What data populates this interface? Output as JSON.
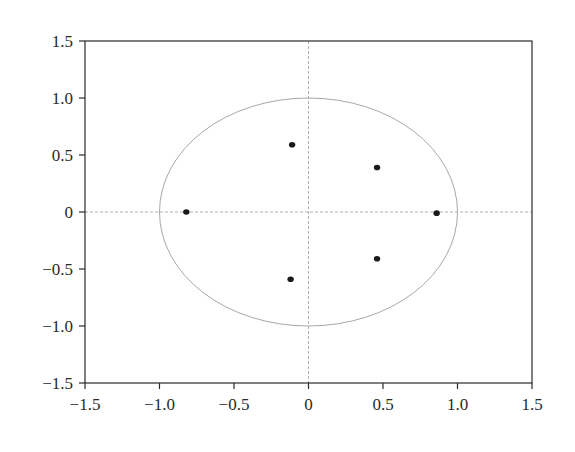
{
  "chart_data": {
    "type": "scatter",
    "title": "",
    "xlabel": "",
    "ylabel": "",
    "xlim": [
      -1.5,
      1.5
    ],
    "ylim": [
      -1.5,
      1.5
    ],
    "grid": false,
    "legend": null,
    "x_ticks": [
      "-1.5",
      "-1.0",
      "-0.5",
      "0",
      "0.5",
      "1.0",
      "1.5"
    ],
    "y_ticks": [
      "1.5",
      "1.0",
      "0.5",
      "0",
      "-0.5",
      "-1.0",
      "-1.5"
    ],
    "reference_lines": [
      {
        "orientation": "horizontal",
        "value": 0,
        "style": "dashed"
      },
      {
        "orientation": "vertical",
        "value": 0,
        "style": "dashed"
      }
    ],
    "unit_circle": {
      "center": [
        0,
        0
      ],
      "radius": 1.0
    },
    "series": [
      {
        "name": "points",
        "x": [
          -0.82,
          -0.11,
          0.46,
          0.86,
          0.46,
          -0.12
        ],
        "y": [
          0.0,
          0.59,
          0.39,
          -0.01,
          -0.41,
          -0.59
        ]
      }
    ]
  },
  "colors": {
    "axis": "#2a2a2a",
    "reference": "#b0b0b0",
    "circle": "#a8a8a8",
    "points": "#1a1a1a"
  }
}
